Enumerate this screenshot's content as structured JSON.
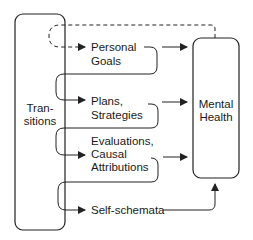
{
  "diagram": {
    "nodes": {
      "transitions": {
        "line1": "Tran-",
        "line2": "sitions"
      },
      "mental_health": {
        "line1": "Mental",
        "line2": "Health"
      },
      "personal_goals": {
        "line1": "Personal",
        "line2": "Goals"
      },
      "plans": {
        "line1": "Plans,",
        "line2": "Strategies"
      },
      "evaluations": {
        "line1": "Evaluations,",
        "line2": "Causal",
        "line3": "Attributions"
      },
      "self_schemata": {
        "line1": "Self-schemata"
      }
    },
    "edges": [
      {
        "from": "mental_health",
        "to": "personal_goals",
        "style": "dashed"
      },
      {
        "from": "transitions",
        "to": "plans",
        "style": "solid"
      },
      {
        "from": "transitions",
        "to": "evaluations",
        "style": "solid"
      },
      {
        "from": "transitions",
        "to": "self_schemata",
        "style": "solid"
      },
      {
        "from": "personal_goals",
        "to": "mental_health",
        "style": "solid"
      },
      {
        "from": "plans",
        "to": "mental_health",
        "style": "solid"
      },
      {
        "from": "evaluations",
        "to": "mental_health",
        "style": "solid"
      },
      {
        "from": "self_schemata",
        "to": "mental_health",
        "style": "solid"
      }
    ],
    "colors": {
      "stroke": "#222222",
      "background": "#ffffff"
    }
  }
}
